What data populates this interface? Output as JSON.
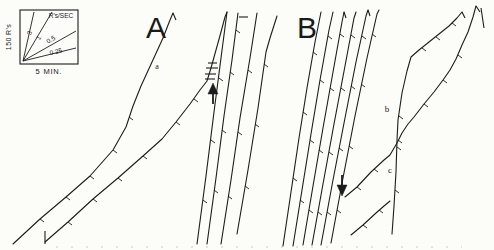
{
  "figure": {
    "panel_a_label": "A",
    "panel_b_label": "B",
    "trace_labels": {
      "a": "a",
      "b": "b",
      "c": "c"
    },
    "ink_color": "#1c1c1c",
    "paper_color": "#fcfcf9",
    "baseline_color": "#ccccc4"
  },
  "legend": {
    "y_axis_label": "150 R's",
    "x_axis_label": "5 MIN.",
    "rate_unit_label": "R's/SEC",
    "box": [
      20,
      10,
      58,
      54
    ],
    "origin": [
      23,
      61
    ],
    "ray_ends": [
      [
        34,
        12
      ],
      [
        52,
        12
      ],
      [
        76,
        31
      ],
      [
        76,
        48
      ]
    ],
    "rates": [
      {
        "label": "3",
        "x": 30,
        "y": 33,
        "angle": -72
      },
      {
        "label": "1",
        "x": 39,
        "y": 38,
        "angle": -56
      },
      {
        "label": "0.5",
        "x": 51,
        "y": 40,
        "angle": -30
      },
      {
        "label": "0.25",
        "x": 56,
        "y": 52,
        "angle": -14
      }
    ]
  },
  "chart_data": {
    "type": "line",
    "x_scale_label": "5 MIN.",
    "y_scale_label": "150 R's",
    "rate_guide_values_r_per_sec": [
      3,
      1,
      0.5,
      0.25
    ],
    "baseline": {
      "y": 247,
      "x1": 56,
      "x2": 462
    },
    "traces": [
      {
        "name": "record-a1",
        "points": [
          [
            13,
            244
          ],
          [
            40,
            219
          ],
          [
            66,
            197
          ],
          [
            90,
            176
          ],
          [
            113,
            150
          ],
          [
            126,
            127
          ],
          [
            133,
            106
          ],
          [
            141,
            86
          ],
          [
            152,
            62
          ],
          [
            163,
            38
          ],
          [
            170,
            20
          ],
          [
            173,
            13
          ]
        ],
        "pips": [
          [
            40,
            219
          ],
          [
            66,
            197
          ],
          [
            90,
            176
          ],
          [
            113,
            150
          ],
          [
            129,
            117
          ]
        ]
      },
      {
        "name": "record-a2",
        "points": [
          [
            45,
            242
          ],
          [
            68,
            222
          ],
          [
            93,
            199
          ],
          [
            118,
            178
          ],
          [
            143,
            156
          ],
          [
            162,
            139
          ],
          [
            176,
            122
          ],
          [
            190,
            104
          ],
          [
            200,
            90
          ],
          [
            207,
            81
          ],
          [
            211,
            68
          ],
          [
            216,
            50
          ],
          [
            221,
            32
          ],
          [
            225,
            17
          ],
          [
            227,
            12
          ]
        ],
        "pips": [
          [
            68,
            222
          ],
          [
            93,
            199
          ],
          [
            118,
            178
          ],
          [
            143,
            156
          ],
          [
            176,
            122
          ],
          [
            194,
            99
          ]
        ]
      },
      {
        "name": "steep-a-1",
        "points": [
          [
            197,
            244
          ],
          [
            206,
            176
          ],
          [
            214,
            112
          ],
          [
            221,
            58
          ],
          [
            227,
            12
          ]
        ],
        "pips": [
          [
            203,
            200
          ],
          [
            211,
            140
          ],
          [
            219,
            78
          ]
        ]
      },
      {
        "name": "steep-a-2",
        "points": [
          [
            207,
            244
          ],
          [
            216,
            178
          ],
          [
            224,
            116
          ],
          [
            232,
            60
          ],
          [
            238,
            13
          ]
        ],
        "pips": [
          [
            214,
            190
          ],
          [
            222,
            130
          ],
          [
            230,
            72
          ],
          [
            236,
            30
          ]
        ]
      },
      {
        "name": "steep-a-3",
        "points": [
          [
            221,
            244
          ],
          [
            231,
            180
          ],
          [
            240,
            118
          ],
          [
            250,
            58
          ],
          [
            257,
            13
          ]
        ],
        "pips": [
          [
            228,
            196
          ],
          [
            238,
            132
          ],
          [
            248,
            70
          ]
        ]
      },
      {
        "name": "steep-a-4",
        "points": [
          [
            237,
            234
          ],
          [
            248,
            170
          ],
          [
            258,
            108
          ],
          [
            266,
            52
          ],
          [
            270,
            38
          ],
          [
            277,
            16
          ]
        ],
        "pips": [
          [
            245,
            186
          ],
          [
            255,
            124
          ],
          [
            264,
            64
          ]
        ]
      },
      {
        "name": "b-run-1",
        "points": [
          [
            283,
            246
          ],
          [
            291,
            192
          ],
          [
            299,
            138
          ],
          [
            307,
            88
          ],
          [
            315,
            42
          ],
          [
            321,
            12
          ]
        ],
        "pips": [
          [
            293,
            178
          ],
          [
            303,
            112
          ],
          [
            313,
            52
          ]
        ]
      },
      {
        "name": "b-run-2",
        "points": [
          [
            293,
            246
          ],
          [
            302,
            190
          ],
          [
            311,
            134
          ],
          [
            320,
            80
          ],
          [
            329,
            30
          ],
          [
            333,
            12
          ]
        ],
        "pips": [
          [
            300,
            200
          ],
          [
            310,
            140
          ],
          [
            320,
            80
          ],
          [
            328,
            36
          ]
        ]
      },
      {
        "name": "b-run-3",
        "points": [
          [
            303,
            245
          ],
          [
            313,
            186
          ],
          [
            323,
            128
          ],
          [
            333,
            72
          ],
          [
            342,
            22
          ],
          [
            344,
            12
          ]
        ],
        "pips": [
          [
            309,
            210
          ],
          [
            319,
            150
          ],
          [
            330,
            88
          ],
          [
            340,
            34
          ]
        ]
      },
      {
        "name": "b-run-4",
        "points": [
          [
            312,
            245
          ],
          [
            323,
            184
          ],
          [
            334,
            124
          ],
          [
            345,
            66
          ],
          [
            354,
            18
          ],
          [
            356,
            12
          ]
        ],
        "pips": [
          [
            318,
            212
          ],
          [
            329,
            152
          ],
          [
            341,
            88
          ],
          [
            351,
            35
          ]
        ]
      },
      {
        "name": "b-run-5",
        "points": [
          [
            321,
            245
          ],
          [
            333,
            180
          ],
          [
            345,
            118
          ],
          [
            356,
            62
          ],
          [
            366,
            16
          ],
          [
            368,
            10
          ]
        ],
        "pips": [
          [
            327,
            212
          ],
          [
            339,
            148
          ],
          [
            351,
            86
          ],
          [
            362,
            36
          ]
        ]
      },
      {
        "name": "b-run-6",
        "points": [
          [
            331,
            243
          ],
          [
            343,
            178
          ],
          [
            355,
            116
          ],
          [
            367,
            58
          ],
          [
            377,
            14
          ],
          [
            379,
            10
          ]
        ],
        "pips": [
          [
            337,
            210
          ],
          [
            349,
            146
          ],
          [
            361,
            84
          ],
          [
            372,
            34
          ]
        ]
      },
      {
        "name": "record-c",
        "points": [
          [
            345,
            197
          ],
          [
            357,
            187
          ],
          [
            371,
            172
          ],
          [
            384,
            160
          ],
          [
            390,
            155
          ],
          [
            397,
            143
          ],
          [
            402,
            133
          ],
          [
            408,
            124
          ],
          [
            414,
            117
          ],
          [
            424,
            104
          ],
          [
            434,
            92
          ],
          [
            443,
            80
          ],
          [
            450,
            70
          ],
          [
            456,
            59
          ],
          [
            462,
            45
          ],
          [
            468,
            32
          ],
          [
            473,
            17
          ],
          [
            476,
            6
          ]
        ],
        "pips": [
          [
            357,
            187
          ],
          [
            374,
            169
          ],
          [
            398,
            140
          ],
          [
            424,
            104
          ],
          [
            443,
            80
          ],
          [
            458,
            55
          ]
        ]
      },
      {
        "name": "record-b",
        "points": [
          [
            392,
            234
          ],
          [
            394,
            206
          ],
          [
            396,
            172
          ],
          [
            397,
            140
          ],
          [
            398,
            120
          ],
          [
            402,
            93
          ],
          [
            407,
            71
          ],
          [
            411,
            57
          ],
          [
            419,
            50
          ],
          [
            429,
            42
          ],
          [
            439,
            34
          ],
          [
            449,
            26
          ],
          [
            457,
            18
          ],
          [
            462,
            12
          ]
        ],
        "pips": [
          [
            395,
            190
          ],
          [
            397,
            147
          ],
          [
            399,
            116
          ],
          [
            422,
            48
          ],
          [
            436,
            37
          ],
          [
            452,
            23
          ]
        ]
      },
      {
        "name": "segment-bottom-b",
        "points": [
          [
            351,
            235
          ],
          [
            363,
            225
          ],
          [
            376,
            213
          ],
          [
            384,
            206
          ],
          [
            390,
            201
          ]
        ],
        "pips": [
          [
            363,
            225
          ],
          [
            379,
            210
          ]
        ]
      }
    ],
    "ticks": [
      {
        "name": "start-tick-a2",
        "p": [
          [
            45,
            231
          ],
          [
            45,
            244
          ]
        ]
      },
      {
        "name": "grain-dash-1",
        "p": [
          [
            205,
            79
          ],
          [
            215,
            79
          ]
        ]
      },
      {
        "name": "grain-dash-2",
        "p": [
          [
            205,
            74
          ],
          [
            216,
            74
          ]
        ]
      },
      {
        "name": "grain-dash-3",
        "p": [
          [
            206,
            68
          ],
          [
            218,
            68
          ]
        ]
      },
      {
        "name": "grain-dash-4",
        "p": [
          [
            208,
            63
          ],
          [
            217,
            63
          ]
        ]
      },
      {
        "name": "top-dash-steep-a-2",
        "p": [
          [
            239,
            17
          ],
          [
            248,
            17
          ]
        ]
      },
      {
        "name": "top-hook-a1",
        "p": [
          [
            173,
            13
          ],
          [
            176,
            20
          ]
        ]
      },
      {
        "name": "top-hook-brun3",
        "p": [
          [
            344,
            12
          ],
          [
            346,
            18
          ]
        ]
      },
      {
        "name": "top-hook-brun5",
        "p": [
          [
            368,
            10
          ],
          [
            370,
            16
          ]
        ]
      },
      {
        "name": "top-peak-record-b",
        "p": [
          [
            462,
            12
          ],
          [
            465,
            18
          ]
        ]
      },
      {
        "name": "top-hook-record-c",
        "p": [
          [
            476,
            6
          ],
          [
            480,
            12
          ]
        ]
      },
      {
        "name": "reset-line-right",
        "p": [
          [
            481,
            8
          ],
          [
            484,
            28
          ]
        ]
      }
    ],
    "arrows": [
      {
        "name": "event-arrow-up-a",
        "dir": "up",
        "stem": [
          [
            213,
            104
          ],
          [
            213,
            92
          ]
        ],
        "head": [
          [
            208,
            94
          ],
          [
            218,
            94
          ],
          [
            213,
            83
          ]
        ]
      },
      {
        "name": "event-arrow-down-b",
        "dir": "down",
        "stem": [
          [
            342,
            175
          ],
          [
            342,
            187
          ]
        ],
        "head": [
          [
            337,
            185
          ],
          [
            347,
            185
          ],
          [
            342,
            196
          ]
        ]
      }
    ]
  }
}
